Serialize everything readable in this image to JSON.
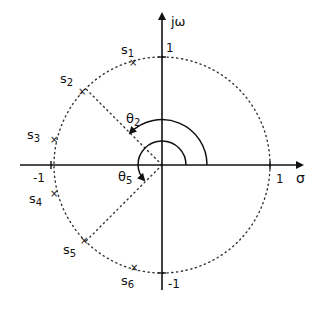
{
  "diagram": {
    "type": "s-plane pole plot",
    "axes": {
      "horizontal_label": "σ",
      "vertical_label": "jω",
      "ticks": {
        "x_pos": "1",
        "x_neg": "-1",
        "y_pos": "1",
        "y_neg": "-1"
      }
    },
    "unit_circle": {
      "style": "dotted",
      "radius": 1
    },
    "poles": [
      {
        "label": "s",
        "sub": "1",
        "angle_deg": 105
      },
      {
        "label": "s",
        "sub": "2",
        "angle_deg": 135
      },
      {
        "label": "s",
        "sub": "3",
        "angle_deg": 165
      },
      {
        "label": "s",
        "sub": "4",
        "angle_deg": 195
      },
      {
        "label": "s",
        "sub": "5",
        "angle_deg": 225
      },
      {
        "label": "s",
        "sub": "6",
        "angle_deg": 255
      }
    ],
    "angles": [
      {
        "label": "θ",
        "sub": "2",
        "to_pole": "s2",
        "angle_deg": 135
      },
      {
        "label": "θ",
        "sub": "5",
        "to_pole": "s5",
        "angle_deg": 225
      }
    ],
    "pole_marker": "×"
  }
}
